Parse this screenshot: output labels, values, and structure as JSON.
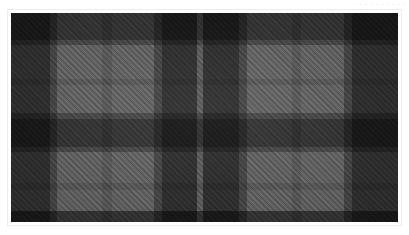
{
  "watermark": {
    "text": "· · · · · · ·  · · · ·"
  },
  "image": {
    "title": "Tartan fabric swatch",
    "kind": "woven-plaid-textile",
    "colorway": "monochrome grey",
    "weave": "2/2 twill",
    "frame_color": "#ffffff",
    "frame_border_color": "#ececec"
  },
  "palette": {
    "darkest": "#3c3c3c",
    "dark": "#4a4a4a",
    "mid_dark": "#6e6e6e",
    "mid": "#7c7c7c",
    "base": "#8c8c8c",
    "light": "#9b9b9b",
    "lightest": "#a6a6a6",
    "overcheck": "#b0b0b0"
  },
  "sett": {
    "repeat_px": 131,
    "symmetry": "reflective",
    "warp_stripes": [
      {
        "pos_pct": 0.0,
        "width_pct": 10.0,
        "color": "#4a4a4a",
        "name": "dark-block"
      },
      {
        "pos_pct": 10.0,
        "width_pct": 2.0,
        "color": "#6e6e6e",
        "name": "shadow-edge"
      },
      {
        "pos_pct": 12.0,
        "width_pct": 11.5,
        "color": "#9b9b9b",
        "name": "light-ground"
      },
      {
        "pos_pct": 23.5,
        "width_pct": 2.5,
        "color": "#8a8a8a",
        "name": "overcheck-grey"
      },
      {
        "pos_pct": 26.0,
        "width_pct": 11.0,
        "color": "#9b9b9b",
        "name": "light-ground"
      },
      {
        "pos_pct": 37.0,
        "width_pct": 2.0,
        "color": "#6e6e6e",
        "name": "shadow-edge"
      },
      {
        "pos_pct": 39.0,
        "width_pct": 9.0,
        "color": "#4a4a4a",
        "name": "dark-block"
      },
      {
        "pos_pct": 48.0,
        "width_pct": 1.6,
        "color": "#8f8f8f",
        "name": "pin-stripe-light"
      },
      {
        "pos_pct": 49.6,
        "width_pct": 9.4,
        "color": "#4a4a4a",
        "name": "dark-block"
      },
      {
        "pos_pct": 59.0,
        "width_pct": 2.0,
        "color": "#6e6e6e",
        "name": "shadow-edge"
      },
      {
        "pos_pct": 61.0,
        "width_pct": 11.5,
        "color": "#9b9b9b",
        "name": "light-ground"
      },
      {
        "pos_pct": 72.5,
        "width_pct": 2.5,
        "color": "#8a8a8a",
        "name": "overcheck-grey"
      },
      {
        "pos_pct": 75.0,
        "width_pct": 11.0,
        "color": "#9b9b9b",
        "name": "light-ground"
      },
      {
        "pos_pct": 86.0,
        "width_pct": 2.0,
        "color": "#6e6e6e",
        "name": "shadow-edge"
      },
      {
        "pos_pct": 88.0,
        "width_pct": 12.0,
        "color": "#4a4a4a",
        "name": "dark-block"
      }
    ],
    "weft_stripes": [
      {
        "pos_pct": 0.0,
        "width_pct": 13.0,
        "color": "#4d4d4d",
        "name": "dark-band"
      },
      {
        "pos_pct": 13.0,
        "width_pct": 2.5,
        "color": "#6e6e6e",
        "name": "shadow-edge"
      },
      {
        "pos_pct": 15.5,
        "width_pct": 16.0,
        "color": "#9b9b9b",
        "name": "light-band"
      },
      {
        "pos_pct": 31.5,
        "width_pct": 3.0,
        "color": "#8a8a8a",
        "name": "overcheck-grey"
      },
      {
        "pos_pct": 34.5,
        "width_pct": 13.5,
        "color": "#9b9b9b",
        "name": "light-band"
      },
      {
        "pos_pct": 48.0,
        "width_pct": 2.5,
        "color": "#6e6e6e",
        "name": "shadow-edge"
      },
      {
        "pos_pct": 50.5,
        "width_pct": 13.5,
        "color": "#4d4d4d",
        "name": "dark-band"
      },
      {
        "pos_pct": 64.0,
        "width_pct": 2.5,
        "color": "#6e6e6e",
        "name": "shadow-edge"
      },
      {
        "pos_pct": 66.5,
        "width_pct": 15.0,
        "color": "#9b9b9b",
        "name": "light-band"
      },
      {
        "pos_pct": 81.5,
        "width_pct": 3.0,
        "color": "#8a8a8a",
        "name": "overcheck-grey"
      },
      {
        "pos_pct": 84.5,
        "width_pct": 10.0,
        "color": "#9b9b9b",
        "name": "light-band"
      },
      {
        "pos_pct": 94.5,
        "width_pct": 5.5,
        "color": "#4d4d4d",
        "name": "dark-band"
      }
    ]
  }
}
